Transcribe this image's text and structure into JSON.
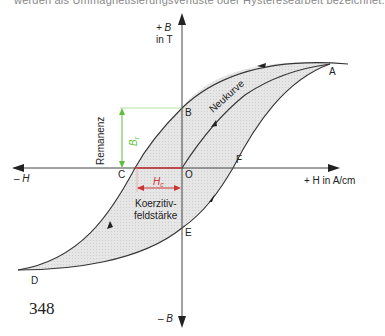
{
  "header": {
    "cut_text": "werden als Ummagnetisierungsverluste oder Hysteresearbeit bezeichnet."
  },
  "axes": {
    "y_pos_label": "+ B",
    "y_pos_unit": "in T",
    "y_neg_label": "– B",
    "x_pos_label": "+ H in A/cm",
    "x_neg_label": "– H"
  },
  "points": {
    "A": "A",
    "B": "B",
    "C": "C",
    "D": "D",
    "E": "E",
    "F": "F",
    "O": "O"
  },
  "annotations": {
    "neukurve": "Neukurve",
    "remanenz": "Remanenz",
    "br": "B",
    "br_sub": "r",
    "hc": "H",
    "hc_sub": "c",
    "koerzitiv_line1": "Koerzitiv-",
    "koerzitiv_line2": "feldstärke"
  },
  "colors": {
    "loop_fill": "#e2e2e2",
    "remanenz": "#5cbf3c",
    "coercive": "#cc3333",
    "axis": "#333333"
  },
  "page_number": "348"
}
